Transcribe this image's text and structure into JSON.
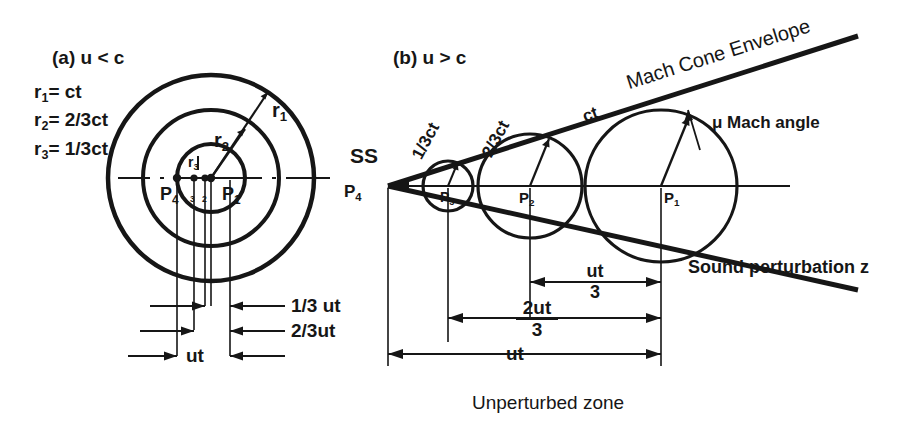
{
  "figure": {
    "background_color": "#ffffff",
    "ink_color": "#161616",
    "panel_a": {
      "title": "(a) u < c",
      "legend": [
        {
          "sym": "r",
          "idx": "1",
          "eq": "= ct"
        },
        {
          "sym": "r",
          "idx": "2",
          "eq": "= 2/3ct"
        },
        {
          "sym": "r",
          "idx": "3",
          "eq": "= 1/3ct"
        }
      ],
      "radius_labels": [
        {
          "text": "r",
          "idx": "1"
        },
        {
          "text": "r",
          "idx": "2"
        },
        {
          "text": "r",
          "idx": "3"
        }
      ],
      "points": [
        {
          "text": "P",
          "idx": "4"
        },
        {
          "text": "P",
          "idx": "3"
        },
        {
          "text": "P",
          "idx": "2"
        },
        {
          "text": "P",
          "idx": "1"
        }
      ],
      "dimensions": [
        "1/3 ut",
        "2/3ut",
        "ut"
      ]
    },
    "panel_b": {
      "title": "(b) u > c",
      "source_label": "SS",
      "wave_labels": [
        "1/3ct",
        "2/3ct",
        "ct"
      ],
      "envelope_label": "Mach Cone Envelope",
      "angle_label": "μ Mach angle",
      "perturbation_label": "Sound perturbation z",
      "zone_label": "Unperturbed zone",
      "points": [
        {
          "text": "P",
          "idx": "4"
        },
        {
          "text": "P",
          "idx": "3"
        },
        {
          "text": "P",
          "idx": "2"
        },
        {
          "text": "P",
          "idx": "1"
        }
      ],
      "dimensions": [
        {
          "num": "ut",
          "den": "3"
        },
        {
          "num": "2ut",
          "den": "3"
        },
        {
          "plain": "ut"
        }
      ]
    }
  }
}
